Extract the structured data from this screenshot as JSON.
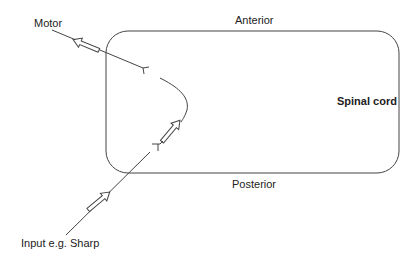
{
  "diagram": {
    "labels": {
      "motor": "Motor",
      "anterior": "Anterior",
      "spinal_cord": "Spinal cord",
      "posterior": "Posterior",
      "input": "Input e.g. Sharp"
    },
    "colors": {
      "stroke": "#444444",
      "text": "#222222",
      "background": "#ffffff"
    },
    "spinal_cord_box": {
      "x": 106,
      "y": 31,
      "width": 293,
      "height": 142,
      "radius": 20
    },
    "pathways": [
      {
        "name": "sensory-input",
        "direction": "toward spinal cord"
      },
      {
        "name": "interneuron",
        "direction": "posterior to anterior"
      },
      {
        "name": "motor-output",
        "direction": "away from spinal cord"
      }
    ]
  }
}
